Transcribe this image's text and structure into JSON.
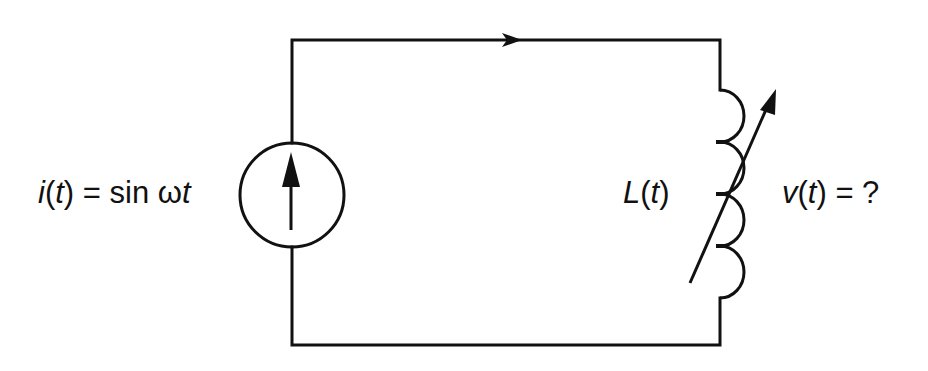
{
  "diagram": {
    "type": "circuit",
    "colors": {
      "stroke": "#111111",
      "background": "#ffffff"
    },
    "source": {
      "kind": "current-source",
      "direction": "up",
      "label_var": "i",
      "label_arg": "t",
      "label_rest": " = sin ω",
      "label_tail": "t",
      "label_full": "i(t) = sin ωt"
    },
    "inductor": {
      "kind": "variable-inductor",
      "turns": 4,
      "label_var": "L",
      "label_arg": "t",
      "label_full": "L(t)"
    },
    "voltage": {
      "label_var": "v",
      "label_arg": "t",
      "label_rest": " = ?",
      "label_full": "v(t) = ?"
    },
    "current_direction": "clockwise"
  }
}
